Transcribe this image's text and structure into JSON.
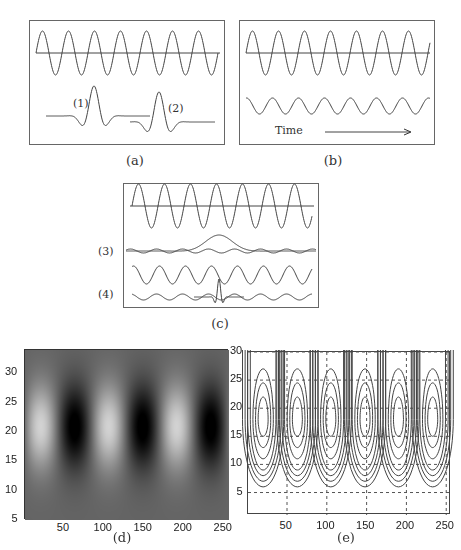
{
  "figure": {
    "panels": [
      {
        "id": "a",
        "caption": "(a)",
        "labels": [
          "(1)",
          "(2)"
        ],
        "description": "Reference sinusoid with two localized wavelets (1) and (2) at different positions"
      },
      {
        "id": "b",
        "caption": "(b)",
        "labels": [
          "Time"
        ],
        "description": "Reference sinusoid and smaller-amplitude sinusoid of the same frequency; time arrow"
      },
      {
        "id": "c",
        "caption": "(c)",
        "labels": [
          "(3)",
          "(4)"
        ],
        "description": "Reference sinusoid; broad wavelet (3) overlaid on signal; sinusoid; narrow wavelet (4) overlaid on signal"
      },
      {
        "id": "d",
        "caption": "(d)",
        "description": "Grayscale scalogram image"
      },
      {
        "id": "e",
        "caption": "(e)",
        "description": "Contour plot of scalogram with dashed grid"
      }
    ]
  },
  "chart_data": [
    {
      "type": "heatmap",
      "panel": "d",
      "title": "",
      "xlabel": "",
      "ylabel": "",
      "xticks": [
        50,
        100,
        150,
        200,
        250
      ],
      "yticks": [
        5,
        10,
        15,
        20,
        25,
        30
      ],
      "xlim": [
        1,
        256
      ],
      "ylim": [
        5,
        34
      ],
      "grid": false,
      "colormap": "gray",
      "features": {
        "bright_columns_x": [
          20,
          105,
          190
        ],
        "dark_columns_x": [
          62,
          148,
          235
        ],
        "peak_scale_y": 21,
        "pattern": "vertical bands strongest between y=12 and y=30, fading to uniform gray below y=10"
      }
    },
    {
      "type": "contour",
      "panel": "e",
      "title": "",
      "xlabel": "",
      "ylabel": "",
      "xticks": [
        50,
        100,
        150,
        200,
        250
      ],
      "yticks": [
        5,
        10,
        15,
        20,
        25,
        30
      ],
      "xlim": [
        1,
        256
      ],
      "ylim": [
        1,
        30
      ],
      "grid": true,
      "grid_style": "dashed",
      "features": {
        "lobe_centers_x": [
          20,
          63,
          105,
          148,
          190,
          233
        ],
        "lobe_center_y": 18,
        "contour_levels_per_lobe": 7,
        "lobe_bottom_y": 6
      }
    }
  ],
  "labels": {
    "a1": "(1)",
    "a2": "(2)",
    "b_time": "Time",
    "c3": "(3)",
    "c4": "(4)",
    "cap_a": "(a)",
    "cap_b": "(b)",
    "cap_c": "(c)",
    "cap_d": "(d)",
    "cap_e": "(e)",
    "d_x": [
      "50",
      "100",
      "150",
      "200",
      "250"
    ],
    "d_y": [
      "5",
      "10",
      "15",
      "20",
      "25",
      "30"
    ],
    "e_x": [
      "50",
      "100",
      "150",
      "200",
      "250"
    ],
    "e_y": [
      "5",
      "10",
      "15",
      "20",
      "25",
      "30"
    ]
  }
}
